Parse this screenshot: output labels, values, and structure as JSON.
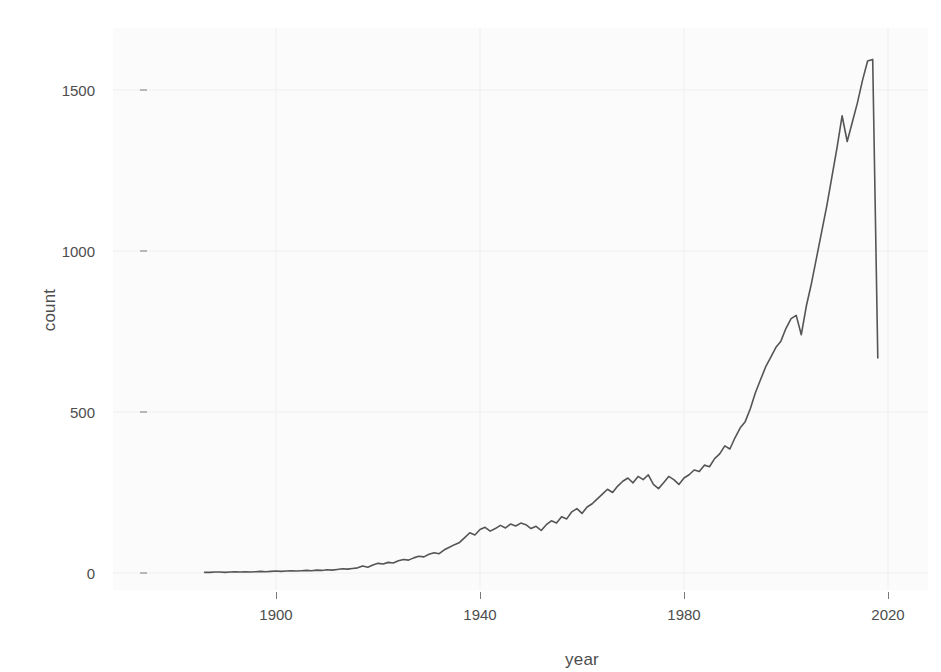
{
  "chart_data": {
    "type": "line",
    "title": "",
    "xlabel": "year",
    "ylabel": "count",
    "xlim": [
      1886,
      2020
    ],
    "ylim": [
      -40,
      1700
    ],
    "xticks": [
      1900,
      1940,
      1980,
      2020
    ],
    "yticks": [
      0,
      500,
      1000,
      1500
    ],
    "xtick_labels": [
      "1900",
      "1940",
      "1980",
      "2020"
    ],
    "ytick_labels": [
      "0",
      "500",
      "1000",
      "1500"
    ],
    "grid": true,
    "legend": "none",
    "line_color": "#555555",
    "panel_color": "#fbfbfb",
    "grid_color": "#f0f0f0",
    "axis_text_color": "#4d4d4d",
    "series": [
      {
        "name": "count",
        "x": [
          1886,
          1887,
          1888,
          1889,
          1890,
          1891,
          1892,
          1893,
          1894,
          1895,
          1896,
          1897,
          1898,
          1899,
          1900,
          1901,
          1902,
          1903,
          1904,
          1905,
          1906,
          1907,
          1908,
          1909,
          1910,
          1911,
          1912,
          1913,
          1914,
          1915,
          1916,
          1917,
          1918,
          1919,
          1920,
          1921,
          1922,
          1923,
          1924,
          1925,
          1926,
          1927,
          1928,
          1929,
          1930,
          1931,
          1932,
          1933,
          1934,
          1935,
          1936,
          1937,
          1938,
          1939,
          1940,
          1941,
          1942,
          1943,
          1944,
          1945,
          1946,
          1947,
          1948,
          1949,
          1950,
          1951,
          1952,
          1953,
          1954,
          1955,
          1956,
          1957,
          1958,
          1959,
          1960,
          1961,
          1962,
          1963,
          1964,
          1965,
          1966,
          1967,
          1968,
          1969,
          1970,
          1971,
          1972,
          1973,
          1974,
          1975,
          1976,
          1977,
          1978,
          1979,
          1980,
          1981,
          1982,
          1983,
          1984,
          1985,
          1986,
          1987,
          1988,
          1989,
          1990,
          1991,
          1992,
          1993,
          1994,
          1995,
          1996,
          1997,
          1998,
          1999,
          2000,
          2001,
          2002,
          2003,
          2004,
          2005,
          2006,
          2007,
          2008,
          2009,
          2010,
          2011,
          2012,
          2013,
          2014,
          2015,
          2016,
          2017,
          2018
        ],
        "y": [
          2,
          2,
          3,
          3,
          2,
          3,
          4,
          3,
          4,
          3,
          4,
          5,
          4,
          5,
          6,
          5,
          6,
          7,
          6,
          7,
          8,
          7,
          9,
          8,
          10,
          9,
          11,
          13,
          12,
          14,
          16,
          22,
          18,
          25,
          30,
          28,
          33,
          31,
          38,
          42,
          40,
          47,
          52,
          50,
          58,
          63,
          60,
          72,
          80,
          88,
          95,
          110,
          125,
          118,
          135,
          142,
          130,
          138,
          148,
          140,
          152,
          146,
          155,
          150,
          138,
          145,
          132,
          150,
          162,
          155,
          175,
          168,
          190,
          200,
          185,
          205,
          215,
          230,
          245,
          260,
          250,
          270,
          285,
          295,
          280,
          300,
          290,
          305,
          275,
          262,
          280,
          300,
          290,
          275,
          295,
          305,
          320,
          315,
          335,
          330,
          355,
          370,
          395,
          385,
          420,
          450,
          470,
          510,
          560,
          600,
          640,
          670,
          700,
          720,
          760,
          790,
          800,
          740,
          830,
          900,
          980,
          1060,
          1140,
          1230,
          1320,
          1420,
          1340,
          1400,
          1460,
          1530,
          1590,
          1595,
          668
        ]
      }
    ]
  },
  "axis": {
    "y_title": "count",
    "x_title": "year"
  }
}
